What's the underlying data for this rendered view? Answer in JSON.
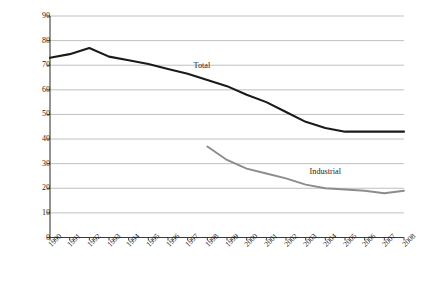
{
  "chart_data": {
    "type": "line",
    "title": "",
    "subtitle": "",
    "xlabel": "",
    "ylabel": "Million Workers",
    "xlim": [
      1990,
      2008
    ],
    "ylim": [
      0,
      90
    ],
    "ytick_step": 10,
    "yticks": [
      0,
      10,
      20,
      30,
      40,
      50,
      60,
      70,
      80,
      90
    ],
    "grid": true,
    "grid_axis": "y",
    "legend_position": "inline-annotations",
    "x": [
      1990,
      1991,
      1992,
      1993,
      1994,
      1995,
      1996,
      1997,
      1998,
      1999,
      2000,
      2001,
      2002,
      2003,
      2004,
      2005,
      2006,
      2007,
      2008
    ],
    "categories": [
      "1990",
      "1991",
      "1992",
      "1993",
      "1994",
      "1995",
      "1996",
      "1997",
      "1998",
      "1999",
      "2000",
      "2001",
      "2002",
      "2003",
      "2004",
      "2005",
      "2006",
      "2007",
      "2008"
    ],
    "series": [
      {
        "name": "Total",
        "color": "#1a1a1a",
        "line_width": 2.1,
        "x": [
          1990,
          1991,
          1992,
          1993,
          1994,
          1995,
          1996,
          1997,
          1998,
          1999,
          2000,
          2001,
          2002,
          2003,
          2004,
          2005,
          2006,
          2007,
          2008
        ],
        "values": [
          73,
          74.5,
          77,
          73.5,
          72,
          70.5,
          68.5,
          66.5,
          64,
          61.5,
          58,
          55,
          51,
          47,
          44.5,
          43,
          43,
          43,
          43
        ],
        "label_x": 1997.3,
        "label_y": 69.5
      },
      {
        "name": "Industrial",
        "color": "#8c8c8c",
        "line_width": 1.9,
        "x": [
          1998,
          1999,
          2000,
          2001,
          2002,
          2003,
          2004,
          2005,
          2006,
          2007,
          2008
        ],
        "values": [
          37,
          31.5,
          28,
          26,
          24,
          21.5,
          20,
          19.5,
          19,
          18,
          19
        ],
        "label_x": 2003.2,
        "label_y": 26.5
      }
    ],
    "annotations": [
      {
        "text": "Total",
        "x": 1997.3,
        "y": 69.5
      },
      {
        "text": "Industrial",
        "x": 2003.2,
        "y": 26.5
      }
    ]
  },
  "colors": {
    "total_line": "#1a1a1a",
    "industrial_line": "#8c8c8c",
    "gridline": "#b0b0b0",
    "axis": "#3a3a3a",
    "background": "#ffffff",
    "text": "#1a1a1a"
  }
}
